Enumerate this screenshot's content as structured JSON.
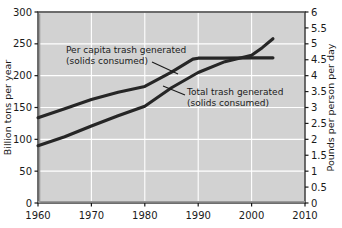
{
  "chart_data": {
    "type": "line",
    "title": "",
    "xlabel": "",
    "ylabel": "Billion tons per year",
    "y2label": "Pounds per person per day",
    "xlim": [
      1960,
      2010
    ],
    "ylim": [
      0,
      300
    ],
    "y2lim": [
      0,
      6
    ],
    "xticks": [
      1960,
      1970,
      1980,
      1990,
      2000,
      2010
    ],
    "xticklabels": [
      "1960",
      "1970",
      "1980",
      "1990",
      "2000",
      "2010"
    ],
    "yticks": [
      0,
      50,
      100,
      150,
      200,
      250,
      300
    ],
    "yticklabels": [
      "0",
      "50",
      "100",
      "150",
      "200",
      "250",
      "300"
    ],
    "y2ticks": [
      0,
      0.5,
      1,
      1.5,
      2,
      2.5,
      3,
      3.5,
      4,
      4.5,
      5,
      5.5,
      6
    ],
    "y2ticklabels": [
      "0",
      "0.5",
      "1",
      "1.5",
      "2",
      "2.5",
      "3",
      "3.5",
      "4",
      "4.5",
      "5",
      "5.5",
      "6"
    ],
    "grid": true,
    "grid_color": "#ffffff",
    "plot_background": "#d2d2d2",
    "line_color": "#262626",
    "legend": "annotations",
    "series": [
      {
        "name": "Per capita trash generated (solids consumed)",
        "axis": "right",
        "units": "pounds per person per day",
        "x": [
          1960,
          1965,
          1970,
          1975,
          1980,
          1985,
          1989,
          1990,
          1995,
          2000,
          2004
        ],
        "values": [
          2.68,
          2.96,
          3.25,
          3.48,
          3.66,
          4.11,
          4.52,
          4.55,
          4.55,
          4.56,
          4.56
        ]
      },
      {
        "name": "Total trash generated (solids consumed)",
        "axis": "left",
        "units": "billion tons per year",
        "x": [
          1960,
          1965,
          1970,
          1975,
          1980,
          1985,
          1990,
          1995,
          2000,
          2002,
          2004
        ],
        "values": [
          90,
          104,
          121,
          137,
          152,
          181,
          205,
          222,
          232,
          244,
          258
        ]
      }
    ],
    "annotations": [
      {
        "name": "per-capita-annotation",
        "line1": "Per capita trash generated",
        "line2": "(solids consumed)",
        "text_x": 66,
        "text_y": 53,
        "leader": [
          152,
          62,
          178,
          74
        ]
      },
      {
        "name": "total-annotation",
        "line1": "Total trash generated",
        "line2": "(solids consumed)",
        "text_x": 187,
        "text_y": 95,
        "leader": [
          185,
          95,
          163,
          86
        ]
      }
    ]
  },
  "axes": {
    "left_title": "Billion tons per year",
    "right_title": "Pounds per person per day"
  }
}
